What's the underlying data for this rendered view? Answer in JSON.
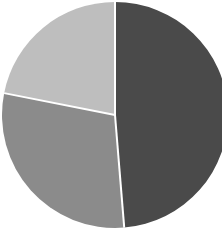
{
  "chart_data": {
    "type": "pie",
    "title": "",
    "categories": [
      "Slice A",
      "Slice B",
      "Slice C"
    ],
    "values": [
      48.7,
      29.4,
      21.9
    ],
    "colors": [
      "#4a4a4a",
      "#8b8b8b",
      "#bebebe"
    ],
    "start_angle_deg": 0,
    "direction": "clockwise",
    "legend": "none",
    "data_labels": "none",
    "slice_separator_color": "#ffffff"
  },
  "layout": {
    "center_x": 115,
    "center_y": 115,
    "radius": 113
  }
}
